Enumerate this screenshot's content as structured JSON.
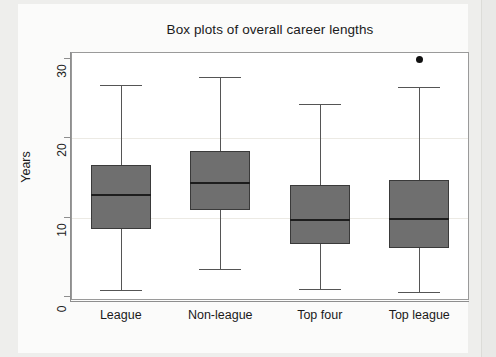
{
  "chart_data": {
    "type": "box",
    "title": "Box plots of overall career lengths",
    "xlabel": "",
    "ylabel": "Years",
    "ylim": [
      0,
      30
    ],
    "yticks": [
      0,
      10,
      20,
      30
    ],
    "ytick_labels": [
      "0",
      "10",
      "20",
      "30"
    ],
    "grid": true,
    "legend": "none",
    "categories": [
      "League",
      "Non-league",
      "Top four",
      "Top league"
    ],
    "boxes": [
      {
        "label": "League",
        "min": 0.8,
        "q1": 8.4,
        "median": 12.7,
        "q3": 16.5,
        "max": 26.6,
        "outliers": []
      },
      {
        "label": "Non-league",
        "min": 3.4,
        "q1": 10.8,
        "median": 14.3,
        "q3": 18.3,
        "max": 27.6,
        "outliers": []
      },
      {
        "label": "Top four",
        "min": 0.9,
        "q1": 6.6,
        "median": 9.6,
        "q3": 14.0,
        "max": 24.2,
        "outliers": []
      },
      {
        "label": "Top league",
        "min": 0.5,
        "q1": 6.1,
        "median": 9.7,
        "q3": 14.6,
        "max": 26.3,
        "outliers": [
          29.8
        ]
      }
    ],
    "colors": {
      "box_fill": "#6f6f6f",
      "box_edge": "#3a3a3a",
      "median": "#1d1d1d",
      "whisker": "#555555",
      "outlier": "#111111",
      "plot_background": "#ffffff",
      "grid": "#eceae4",
      "axis": "#8e8e8e",
      "text": "#1a1a1a"
    }
  }
}
